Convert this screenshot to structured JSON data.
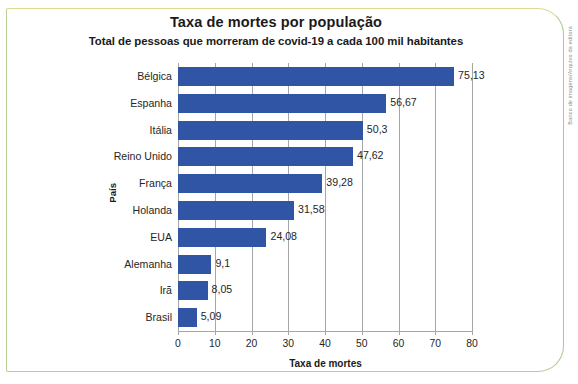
{
  "figure": {
    "credit": "Banco de imagens/Arquivo da editora"
  },
  "chart_data": {
    "type": "bar",
    "orientation": "horizontal",
    "title": "Taxa de mortes por população",
    "subtitle": "Total de pessoas que morreram de covid-19 a cada 100 mil habitantes",
    "xlabel": "Taxa de mortes",
    "ylabel": "País",
    "categories": [
      "Bélgica",
      "Espanha",
      "Itália",
      "Reino Unido",
      "França",
      "Holanda",
      "EUA",
      "Alemanha",
      "Irã",
      "Brasil"
    ],
    "values": [
      75.13,
      56.67,
      50.3,
      47.62,
      39.28,
      31.58,
      24.08,
      9.1,
      8.05,
      5.09
    ],
    "value_labels": [
      "75,13",
      "56,67",
      "50,3",
      "47,62",
      "39,28",
      "31,58",
      "24,08",
      "9,1",
      "8,05",
      "5,09"
    ],
    "xlim": [
      0,
      80
    ],
    "xticks": [
      0,
      10,
      20,
      30,
      40,
      50,
      60,
      70,
      80
    ],
    "xtick_labels": [
      "0",
      "10",
      "20",
      "30",
      "40",
      "50",
      "60",
      "70",
      "80"
    ],
    "grid": "vertical",
    "legend": "none",
    "bar_color": "#2f55a4",
    "gridline_color": "#a6a6a6",
    "text_color": "#262626",
    "frame_color": "#b9cf9a"
  }
}
